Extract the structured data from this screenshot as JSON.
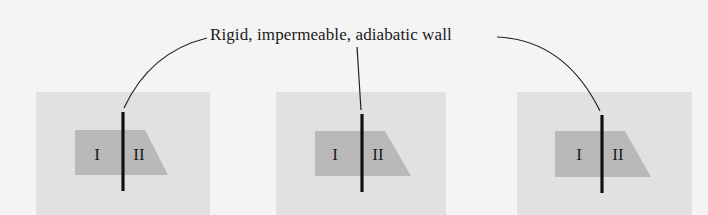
{
  "caption": "Rigid, impermeable, adiabatic wall",
  "colors": {
    "background": "#f4f4f4",
    "panel": "#e1e1e1",
    "gas_region": "#b9b9b9",
    "wall": "#111111",
    "leader": "#222222"
  },
  "panels": [
    {
      "id": "panel-1",
      "region_left_label": "I",
      "region_right_label": "II"
    },
    {
      "id": "panel-2",
      "region_left_label": "I",
      "region_right_label": "II"
    },
    {
      "id": "panel-3",
      "region_left_label": "I",
      "region_right_label": "II"
    }
  ]
}
